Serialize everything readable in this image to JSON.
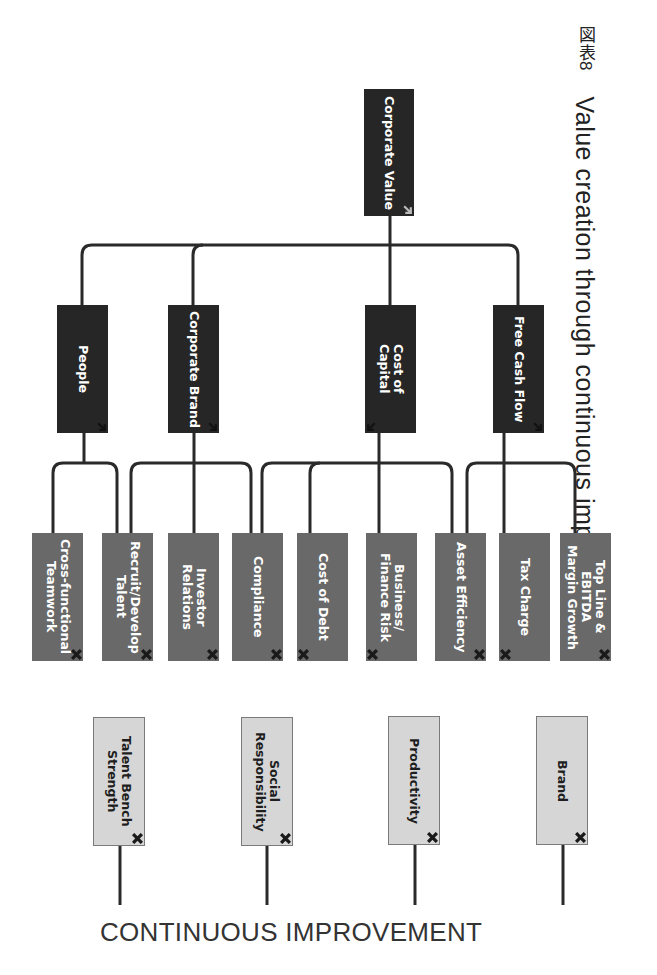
{
  "header": {
    "figure_label": "図表8",
    "title": "Value creation through continuous improvement"
  },
  "root": {
    "label": "Corporate Value"
  },
  "drivers": [
    {
      "label": "People"
    },
    {
      "label": "Corporate Brand"
    },
    {
      "label": "Cost of\nCapital"
    },
    {
      "label": "Free Cash Flow"
    }
  ],
  "levers": [
    {
      "label": "Cross-functional\nTeamwork"
    },
    {
      "label": "Recruit/Develop\nTalent"
    },
    {
      "label": "Investor Relations"
    },
    {
      "label": "Compliance"
    },
    {
      "label": "Cost of Debt"
    },
    {
      "label": "Business/\nFinance Risk"
    },
    {
      "label": "Asset Efficiency"
    },
    {
      "label": "Tax Charge"
    },
    {
      "label": "Top Line & EBITDA\nMargin Growth"
    }
  ],
  "outcomes": [
    {
      "label": "Talent Bench\nStrength"
    },
    {
      "label": "Social\nResponsibility"
    },
    {
      "label": "Productivity"
    },
    {
      "label": "Brand"
    }
  ],
  "footer": {
    "label": "CONTINUOUS IMPROVEMENT"
  },
  "colors": {
    "root_fill": "#262626",
    "driver_fill": "#2b2b2b",
    "lever_fill": "#696969",
    "outcome_fill": "#d6d6d6",
    "connector": "#2a2a2a"
  }
}
